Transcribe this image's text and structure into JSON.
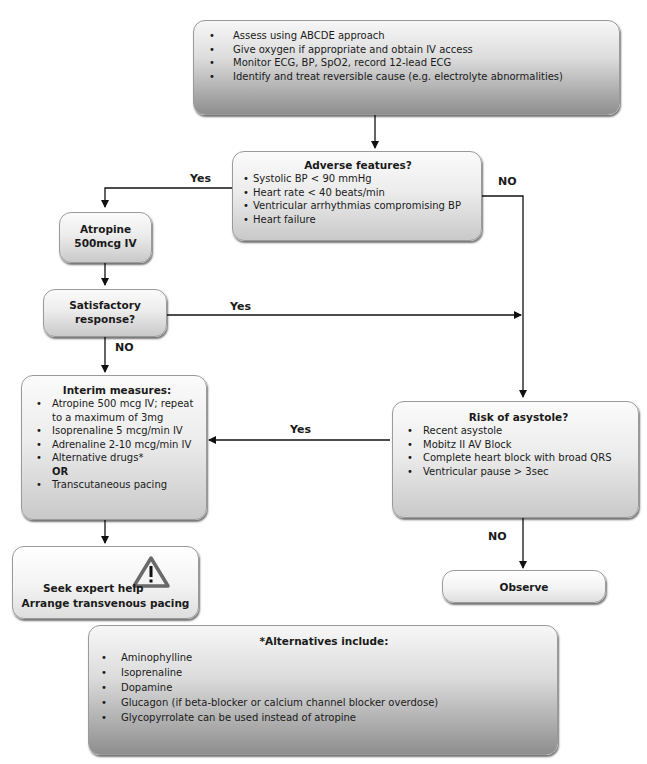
{
  "start_box": {
    "items": [
      "Assess using ABCDE approach",
      "Give oxygen if appropriate and obtain IV access",
      "Monitor ECG, BP, SpO2, record 12-lead ECG",
      "Identify and treat reversible cause (e.g. electrolyte abnormalities)"
    ]
  },
  "adverse_box": {
    "title": "Adverse features?",
    "items": [
      "Systolic BP < 90 mmHg",
      "Heart rate < 40 beats/min",
      "Ventricular arrhythmias compromising BP",
      "Heart failure"
    ]
  },
  "atropine_box": {
    "line1": "Atropine",
    "line2": "500mcg IV"
  },
  "satisfactory_box": {
    "line1": "Satisfactory",
    "line2": "response?"
  },
  "interim_box": {
    "title": "Interim measures:",
    "items": [
      "Atropine 500 mcg IV; repeat to a maximum of 3mg",
      "Isoprenaline 5 mcg/min IV",
      "Adrenaline 2-10 mcg/min IV",
      "Alternative drugs*"
    ],
    "or_label": "OR",
    "last_item": "Transcutaneous pacing"
  },
  "risk_box": {
    "title": "Risk of asystole?",
    "items": [
      "Recent asystole",
      "Mobitz II AV Block",
      "Complete heart block with broad QRS",
      "Ventricular pause > 3sec"
    ]
  },
  "expert_box": {
    "line1": "Seek expert help",
    "line2": "Arrange transvenous pacing",
    "icon": "warning-icon"
  },
  "observe_box": {
    "label": "Observe"
  },
  "alternatives_box": {
    "title": "*Alternatives include:",
    "items": [
      "Aminophylline",
      "Isoprenaline",
      "Dopamine",
      "Glucagon (if beta-blocker or calcium channel blocker overdose)",
      "Glycopyrrolate can be used instead of atropine"
    ]
  },
  "labels": {
    "adverse_yes": "Yes",
    "adverse_no": "NO",
    "satisfactory_yes": "Yes",
    "satisfactory_no": "NO",
    "risk_yes": "Yes",
    "risk_no": "NO"
  },
  "bullet": "•"
}
